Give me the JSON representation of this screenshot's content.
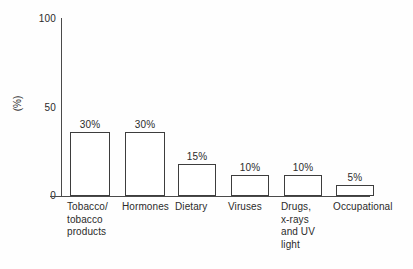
{
  "chart_data": {
    "type": "bar",
    "title": "",
    "subtitle": "",
    "xlabel": "",
    "ylabel": "(%)",
    "ylim": [
      0,
      100
    ],
    "yticks": [
      "0",
      "50",
      "100"
    ],
    "grid": false,
    "legend": false,
    "categories": [
      "Tobacco/\ntobacco\nproducts",
      "Hormones",
      "Dietary",
      "Viruses",
      "Drugs,\nx-rays\nand UV\nlight",
      "Occupational"
    ],
    "values": [
      30,
      30,
      15,
      10,
      10,
      5
    ],
    "value_labels": [
      "30%",
      "30%",
      "15%",
      "10%",
      "10%",
      "5%"
    ],
    "bar_fill": "#ffffff",
    "bar_stroke": "#3d3d3d",
    "axis_color": "#4a4a4a",
    "text_color": "#2b2b2b",
    "background": "#fefefe"
  },
  "axis": {
    "y_title": "(%)",
    "y_tick_top": "100",
    "y_tick_mid": "50",
    "y_tick_bottom": "0"
  },
  "bars": [
    {
      "label": "Tobacco/\ntobacco\nproducts",
      "value_label": "30%",
      "value": 30,
      "left": 9,
      "width": 40
    },
    {
      "label": "Hormones",
      "value_label": "30%",
      "value": 30,
      "left": 64,
      "width": 40
    },
    {
      "label": "Dietary",
      "value_label": "15%",
      "value": 15,
      "left": 117,
      "width": 38
    },
    {
      "label": "Viruses",
      "value_label": "10%",
      "value": 10,
      "left": 170,
      "width": 38
    },
    {
      "label": "Drugs,\nx-rays\nand UV\nlight",
      "value_label": "10%",
      "value": 10,
      "left": 223,
      "width": 38
    },
    {
      "label": "Occupational",
      "value_label": "5%",
      "value": 5,
      "left": 275,
      "width": 38
    }
  ]
}
